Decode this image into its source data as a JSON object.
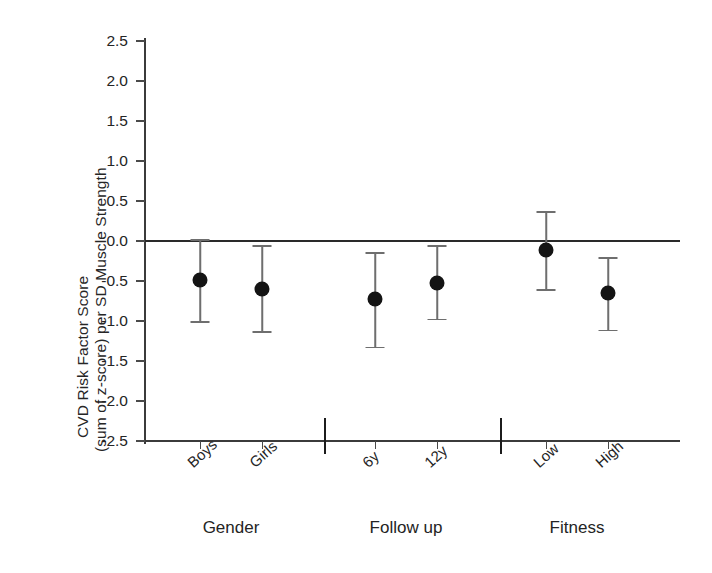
{
  "chart_data": {
    "type": "scatter",
    "title": "",
    "xlabel": "",
    "ylabel_line1": "CVD Risk Factor Score",
    "ylabel_line2": "(sum of z-score) per SD Muscle Strength",
    "ylim": [
      -2.5,
      2.5
    ],
    "grid": false,
    "legend": "none",
    "zero_reference_line": 0.0,
    "yticks": [
      "2.5",
      "2.0",
      "1.5",
      "1.0",
      "0.5",
      "0.0",
      "-0.5",
      "-1.0",
      "-1.5",
      "-2.0",
      "-2.5"
    ],
    "ytick_values": [
      2.5,
      2.0,
      1.5,
      1.0,
      0.5,
      0.0,
      -0.5,
      -1.0,
      -1.5,
      -2.0,
      -2.5
    ],
    "categories": [
      "Boys",
      "Girls",
      "6y",
      "12y",
      "Low",
      "High"
    ],
    "groups": [
      {
        "label": "Gender",
        "categories": [
          "Boys",
          "Girls"
        ]
      },
      {
        "label": "Follow up",
        "categories": [
          "6y",
          "12y"
        ]
      },
      {
        "label": "Fitness",
        "categories": [
          "Low",
          "High"
        ]
      }
    ],
    "values": [
      -0.49,
      -0.6,
      -0.73,
      -0.52,
      -0.11,
      -0.65
    ],
    "ci_low": [
      -1.01,
      -1.14,
      -1.33,
      -0.98,
      -0.61,
      -1.12
    ],
    "ci_high": [
      0.01,
      -0.06,
      -0.15,
      -0.06,
      0.36,
      -0.21
    ],
    "points": [
      {
        "category": "Boys",
        "group": "Gender",
        "value": -0.49,
        "ci_low": -1.01,
        "ci_high": 0.01
      },
      {
        "category": "Girls",
        "group": "Gender",
        "value": -0.6,
        "ci_low": -1.14,
        "ci_high": -0.06
      },
      {
        "category": "6y",
        "group": "Follow up",
        "value": -0.73,
        "ci_low": -1.33,
        "ci_high": -0.15
      },
      {
        "category": "12y",
        "group": "Follow up",
        "value": -0.52,
        "ci_low": -0.98,
        "ci_high": -0.06
      },
      {
        "category": "Low",
        "group": "Fitness",
        "value": -0.11,
        "ci_low": -0.61,
        "ci_high": 0.36
      },
      {
        "category": "High",
        "group": "Fitness",
        "value": -0.65,
        "ci_low": -1.12,
        "ci_high": -0.21
      }
    ],
    "colors": {
      "marker": "#141414",
      "errorbar": "#6e6e6e",
      "axis": "#3b3b3b",
      "zero_line": "#2a2a2a",
      "text": "#242424",
      "background": "#ffffff"
    }
  }
}
